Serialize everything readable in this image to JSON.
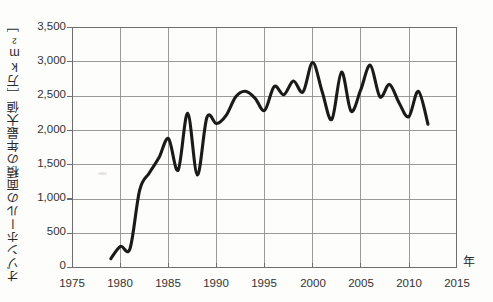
{
  "chart_data": {
    "type": "line",
    "title": "",
    "subtitle": "",
    "xlabel": "年",
    "ylabel": "オゾンホールの面積の年最大値［万km²］",
    "ylabel_main": "オゾンホールの面積の年最大値",
    "ylabel_unit": "［万km²］",
    "xlim": [
      1975,
      2015
    ],
    "ylim": [
      0,
      3500
    ],
    "xticks": [
      1975,
      1980,
      1985,
      1990,
      1995,
      2000,
      2005,
      2010,
      2015
    ],
    "xtick_labels": [
      "1975",
      "1980",
      "1985",
      "1990",
      "1995",
      "2000",
      "2005",
      "2010",
      "2015"
    ],
    "yticks": [
      0,
      500,
      1000,
      1500,
      2000,
      2500,
      3000,
      3500
    ],
    "ytick_labels": [
      "0",
      "500",
      "1,000",
      "1,500",
      "2,000",
      "2,500",
      "3,000",
      "3,500"
    ],
    "grid": true,
    "grid_color": "#8c8c8c",
    "legend": null,
    "line_color": "#1a1a1a",
    "line_width": 3.1,
    "x": [
      1979,
      1980,
      1981,
      1982,
      1983,
      1984,
      1985,
      1986,
      1987,
      1988,
      1989,
      1990,
      1991,
      1992,
      1993,
      1994,
      1995,
      1996,
      1997,
      1998,
      1999,
      2000,
      2001,
      2002,
      2003,
      2004,
      2005,
      2006,
      2007,
      2008,
      2009,
      2010,
      2011,
      2012
    ],
    "values": [
      130,
      310,
      280,
      1130,
      1380,
      1600,
      1880,
      1420,
      2250,
      1350,
      2190,
      2100,
      2220,
      2490,
      2570,
      2470,
      2290,
      2640,
      2520,
      2720,
      2560,
      2990,
      2560,
      2160,
      2850,
      2280,
      2590,
      2950,
      2490,
      2670,
      2400,
      2200,
      2570,
      2090
    ],
    "x_axis_unit_label": "年"
  }
}
